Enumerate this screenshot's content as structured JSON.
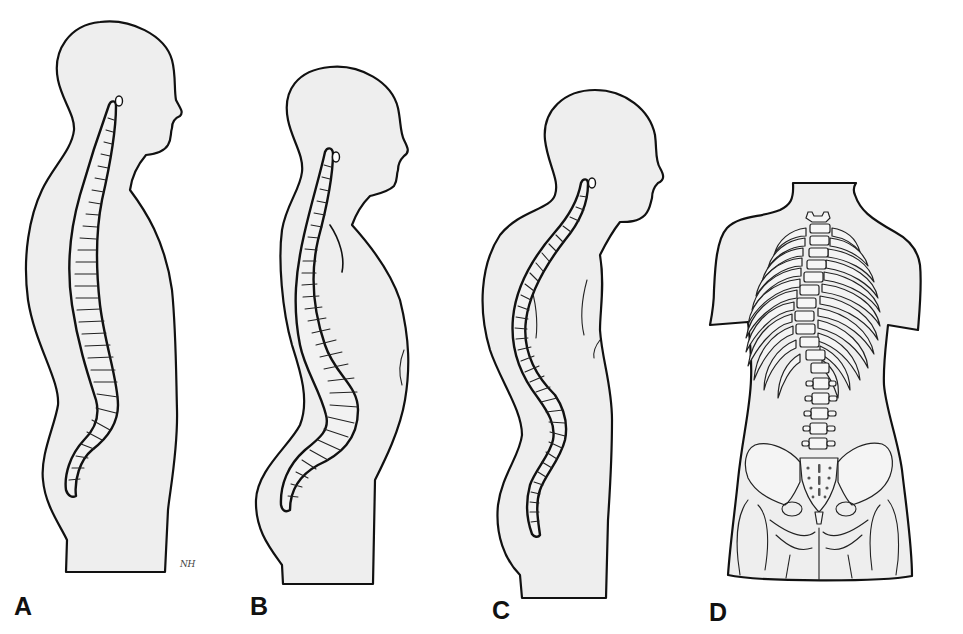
{
  "figure": {
    "fill_color": "#eeeeee",
    "outline_color": "#111111",
    "panels": [
      {
        "label": "A",
        "view": "side",
        "spine_shape": "normal"
      },
      {
        "label": "B",
        "view": "side",
        "spine_shape": "hyperlordosis"
      },
      {
        "label": "C",
        "view": "side",
        "spine_shape": "kyphosis"
      },
      {
        "label": "D",
        "view": "back",
        "spine_shape": "scoliosis"
      }
    ],
    "signature": "NH"
  }
}
